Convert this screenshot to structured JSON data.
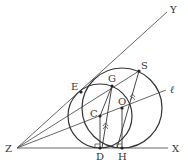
{
  "diagram": {
    "type": "geometry",
    "points": {
      "Z": {
        "label": "Z",
        "x": 17,
        "y": 148
      },
      "X": {
        "label": "X",
        "x": 168,
        "y": 148
      },
      "Y": {
        "label": "Y",
        "x": 167,
        "y": 12
      },
      "l": {
        "label": "ℓ",
        "x": 166,
        "y": 90
      },
      "D": {
        "label": "D",
        "x": 100,
        "y": 148
      },
      "H": {
        "label": "H",
        "x": 122,
        "y": 148
      },
      "C": {
        "label": "C",
        "x": 100,
        "y": 116
      },
      "O": {
        "label": "O",
        "x": 122,
        "y": 108
      },
      "G": {
        "label": "G",
        "x": 112,
        "y": 86
      },
      "S": {
        "label": "S",
        "x": 139,
        "y": 71
      },
      "E": {
        "label": "E",
        "x": 81,
        "y": 92
      }
    },
    "circles": [
      {
        "name": "small-circle",
        "center": "C",
        "r": 32
      },
      {
        "name": "large-circle",
        "center": "O",
        "r": 40
      }
    ],
    "colors": {
      "stroke": "#333333",
      "ray": "#555555",
      "background": "#ffffff"
    }
  }
}
